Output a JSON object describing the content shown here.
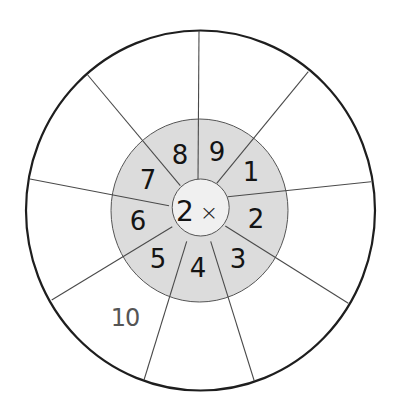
{
  "worksheet": {
    "title": "Multiplication wheel",
    "center": {
      "number": "2",
      "operator": "×"
    },
    "colors": {
      "outer_fill": "#ffffff",
      "outer_stroke": "#1e1e1e",
      "ring_fill": "#dcdcdc",
      "center_fill": "#f0f0f0",
      "spoke": "#4a4a4a",
      "digit": "#141414",
      "answer_text": "#555555"
    },
    "geometry": {
      "outer": {
        "cx": 200.5,
        "cy": 210.5,
        "rx": 174.5,
        "ry": 180
      },
      "ring": {
        "cx": 199.5,
        "cy": 210.5,
        "rx": 88.5,
        "ry": 91.5
      },
      "center": {
        "cx": 200.7,
        "cy": 207.5,
        "r": 28.5
      }
    },
    "spokes": [
      {
        "x1": 198.0,
        "y1": 180.3,
        "x2": 199.0,
        "y2": 30.7
      },
      {
        "x1": 216.7,
        "y1": 183.3,
        "x2": 308.3,
        "y2": 71.7
      },
      {
        "x1": 227.7,
        "y1": 196.7,
        "x2": 371.0,
        "y2": 181.7
      },
      {
        "x1": 225.3,
        "y1": 226.0,
        "x2": 348.3,
        "y2": 303.3
      },
      {
        "x1": 210.7,
        "y1": 241.3,
        "x2": 254.3,
        "y2": 381.0
      },
      {
        "x1": 186.7,
        "y1": 241.3,
        "x2": 144.0,
        "y2": 380.0
      },
      {
        "x1": 172.3,
        "y1": 226.7,
        "x2": 51.7,
        "y2": 300.0
      },
      {
        "x1": 169.0,
        "y1": 205.7,
        "x2": 30.0,
        "y2": 179.0
      },
      {
        "x1": 180.3,
        "y1": 185.7,
        "x2": 87.7,
        "y2": 75.0
      }
    ],
    "factors": [
      {
        "value": "8",
        "x": 180,
        "y": 155
      },
      {
        "value": "9",
        "x": 217,
        "y": 152
      },
      {
        "value": "1",
        "x": 251,
        "y": 172
      },
      {
        "value": "2",
        "x": 256,
        "y": 219
      },
      {
        "value": "3",
        "x": 238,
        "y": 259
      },
      {
        "value": "4",
        "x": 198,
        "y": 268
      },
      {
        "value": "5",
        "x": 158,
        "y": 259
      },
      {
        "value": "6",
        "x": 138,
        "y": 221
      },
      {
        "value": "7",
        "x": 148,
        "y": 180
      }
    ],
    "answers": [
      {
        "for_factor": "8",
        "value": "",
        "x": 145,
        "y": 80
      },
      {
        "for_factor": "9",
        "value": "",
        "x": 255,
        "y": 70
      },
      {
        "for_factor": "1",
        "value": "",
        "x": 330,
        "y": 125
      },
      {
        "for_factor": "2",
        "value": "",
        "x": 335,
        "y": 245
      },
      {
        "for_factor": "3",
        "value": "",
        "x": 295,
        "y": 325
      },
      {
        "for_factor": "4",
        "value": "",
        "x": 200,
        "y": 350
      },
      {
        "for_factor": "5",
        "value": "10",
        "x": 125,
        "y": 318
      },
      {
        "for_factor": "6",
        "value": "",
        "x": 65,
        "y": 240
      },
      {
        "for_factor": "7",
        "value": "",
        "x": 70,
        "y": 130
      }
    ]
  }
}
